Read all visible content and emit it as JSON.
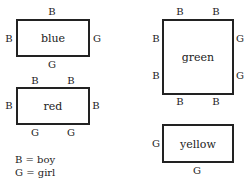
{
  "tables": {
    "blue": {
      "name": "blue",
      "top": [
        "B"
      ],
      "bottom": [
        "G"
      ],
      "left": [
        "B"
      ],
      "right": [
        "G"
      ]
    },
    "red": {
      "name": "red",
      "top": [
        "B",
        "B"
      ],
      "bottom": [
        "G",
        "G"
      ],
      "left": [
        "B"
      ],
      "right": [
        "B"
      ]
    },
    "green": {
      "name": "green",
      "top": [
        "B",
        "B"
      ],
      "bottom": [
        "B",
        "B"
      ],
      "left": [
        "B",
        "B"
      ],
      "right": [
        "G",
        "G"
      ]
    },
    "yellow": {
      "name": "yellow",
      "top": [],
      "bottom": [
        "G"
      ],
      "left": [
        "G"
      ],
      "right": []
    }
  },
  "legend": {
    "boy": "B = boy",
    "girl": "G = girl"
  }
}
